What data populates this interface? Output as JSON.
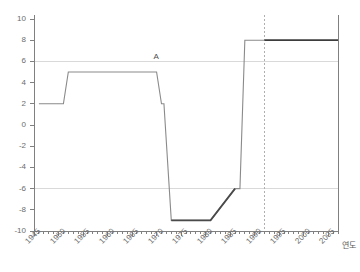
{
  "chart_data": {
    "type": "line",
    "title": "",
    "subtitle": "",
    "xlabel": "연도",
    "ylabel": "",
    "xlim": [
      1945,
      2007
    ],
    "ylim": [
      -10,
      10
    ],
    "grid": true,
    "gridlines_y": [
      6,
      -6
    ],
    "legend_position": "none",
    "x_major_ticks": [
      1945,
      1950,
      1955,
      1960,
      1965,
      1970,
      1975,
      1980,
      1985,
      1990,
      1995,
      2000,
      2005
    ],
    "x_major_tick_labels": [
      "1945",
      "1950",
      "1955",
      "1960",
      "1965",
      "1970",
      "1975",
      "1980",
      "1985",
      "1990",
      "1995",
      "2000",
      "2005"
    ],
    "x_minor_tick_step": 1,
    "y_ticks": [
      10,
      8,
      6,
      4,
      2,
      0,
      -2,
      -4,
      -6,
      -8,
      -10
    ],
    "y_tick_labels": [
      "10",
      "8",
      "6",
      "4",
      "2",
      "0",
      "-2",
      "-4",
      "-6",
      "-8",
      "-10"
    ],
    "series": [
      {
        "name": "series-a",
        "color": "#8a8a8a",
        "x": [
          1946,
          1951,
          1952,
          1970,
          1971,
          1971.5,
          1973,
          1981,
          1986,
          1987,
          1988,
          1992
        ],
        "values": [
          2,
          2,
          5,
          5,
          2,
          2,
          -9,
          -9,
          -6,
          -6,
          8,
          8
        ]
      },
      {
        "name": "series-a-emphasis",
        "color": "#4a4a4a",
        "x": [
          1973,
          1981,
          1986
        ],
        "values": [
          -9,
          -9,
          -6
        ]
      },
      {
        "name": "series-a-post-marker",
        "color": "#3d3d3d",
        "x": [
          1992,
          2007
        ],
        "values": [
          8,
          8
        ]
      }
    ],
    "annotations": [
      {
        "text": "A",
        "x": 1970,
        "y": 5.9,
        "name": "annotation-a"
      }
    ],
    "marker_lines": [
      {
        "name": "dashed-year-marker",
        "x": 1992,
        "style": "dashed",
        "color": "#b0b0b0"
      }
    ],
    "colors": {
      "axis": "#808080",
      "grid": "#d9d9d9",
      "line": "#8a8a8a",
      "line_emphasis": "#3d3d3d",
      "marker": "#b0b0b0",
      "tick_text": "#6b6b6b"
    }
  }
}
